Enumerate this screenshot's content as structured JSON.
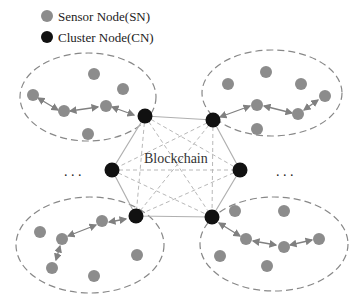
{
  "legend": {
    "sensor_label": "Sensor Node(SN)",
    "cluster_label": "Cluster Node(CN)"
  },
  "center": {
    "label": "Blockchain"
  },
  "ellipsis": {
    "left": ". . .",
    "right": ". . ."
  },
  "colors": {
    "sensor": "#8c8c8c",
    "cluster": "#111111",
    "ellipse": "#888888",
    "hexagon": "#b0b0b0",
    "arrow": "#808080"
  },
  "clusters": [
    {
      "name": "top-left",
      "sensor_count": 7,
      "chain_length": 4
    },
    {
      "name": "top-right",
      "sensor_count": 7,
      "chain_length": 4
    },
    {
      "name": "bottom-left",
      "sensor_count": 7,
      "chain_length": 4
    },
    {
      "name": "bottom-right",
      "sensor_count": 7,
      "chain_length": 4
    }
  ],
  "blockchain_nodes": 6
}
